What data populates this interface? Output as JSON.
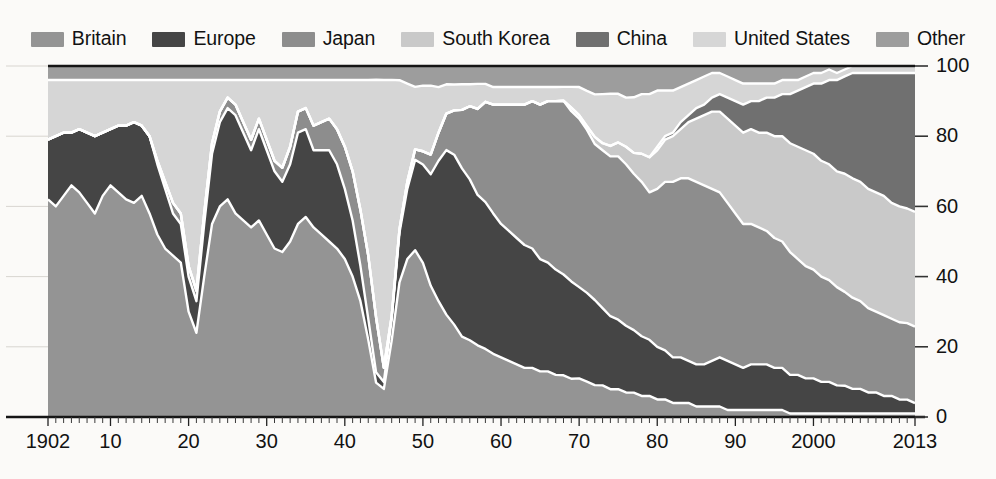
{
  "chart_data": {
    "type": "area",
    "title": "",
    "subtitle": "",
    "xlabel": "",
    "ylabel": "",
    "stacked": true,
    "normalized_percent": true,
    "grid": true,
    "legend_position": "top",
    "xlim": [
      1902,
      2013
    ],
    "ylim": [
      0,
      100
    ],
    "y_ticks": [
      0,
      20,
      40,
      60,
      80,
      100
    ],
    "y_tick_labels": [
      "0",
      "20",
      "40",
      "60",
      "80",
      "100"
    ],
    "y_axis_side": "right",
    "x_tick_years": [
      1902,
      1910,
      1920,
      1930,
      1940,
      1950,
      1960,
      1970,
      1980,
      1990,
      2000,
      2013
    ],
    "x_tick_labels": [
      "1902",
      "10",
      "20",
      "30",
      "40",
      "50",
      "60",
      "70",
      "80",
      "90",
      "2000",
      "2013"
    ],
    "x_minor_step": 1,
    "categories": [
      1902,
      1903,
      1904,
      1905,
      1906,
      1907,
      1908,
      1909,
      1910,
      1911,
      1912,
      1913,
      1914,
      1915,
      1916,
      1917,
      1918,
      1919,
      1920,
      1921,
      1922,
      1923,
      1924,
      1925,
      1926,
      1927,
      1928,
      1929,
      1930,
      1931,
      1932,
      1933,
      1934,
      1935,
      1936,
      1937,
      1938,
      1939,
      1940,
      1941,
      1942,
      1943,
      1944,
      1945,
      1946,
      1947,
      1948,
      1949,
      1950,
      1951,
      1952,
      1953,
      1954,
      1955,
      1956,
      1957,
      1958,
      1959,
      1960,
      1961,
      1962,
      1963,
      1964,
      1965,
      1966,
      1967,
      1968,
      1969,
      1970,
      1971,
      1972,
      1973,
      1974,
      1975,
      1976,
      1977,
      1978,
      1979,
      1980,
      1981,
      1982,
      1983,
      1984,
      1985,
      1986,
      1987,
      1988,
      1989,
      1990,
      1991,
      1992,
      1993,
      1994,
      1995,
      1996,
      1997,
      1998,
      1999,
      2000,
      2001,
      2002,
      2003,
      2004,
      2005,
      2006,
      2007,
      2008,
      2009,
      2010,
      2011,
      2012,
      2013
    ],
    "series": [
      {
        "name": "Britain",
        "color": "#949494",
        "values": [
          62,
          60,
          63,
          66,
          64,
          61,
          58,
          63,
          66,
          64,
          62,
          61,
          63,
          58,
          52,
          48,
          46,
          44,
          30,
          24,
          40,
          55,
          60,
          62,
          58,
          56,
          54,
          56,
          52,
          48,
          47,
          50,
          55,
          57,
          54,
          52,
          50,
          48,
          45,
          40,
          33,
          22,
          10,
          8,
          22,
          38,
          45,
          48,
          47,
          40,
          33,
          28,
          25,
          22,
          21,
          20,
          19,
          18,
          17,
          16,
          15,
          14,
          14,
          13,
          13,
          12,
          12,
          11,
          11,
          10,
          9,
          9,
          8,
          8,
          7,
          7,
          6,
          6,
          5,
          5,
          4,
          4,
          4,
          3,
          3,
          3,
          3,
          2,
          2,
          2,
          2,
          2,
          2,
          2,
          2,
          1,
          1,
          1,
          1,
          1,
          1,
          1,
          1,
          1,
          1,
          1,
          1,
          1,
          1,
          1,
          1,
          1
        ]
      },
      {
        "name": "Europe",
        "color": "#454545",
        "values": [
          17,
          20,
          18,
          15,
          18,
          20,
          22,
          18,
          16,
          19,
          21,
          23,
          20,
          22,
          20,
          17,
          12,
          11,
          10,
          9,
          15,
          20,
          24,
          26,
          28,
          25,
          22,
          26,
          24,
          22,
          20,
          22,
          26,
          25,
          22,
          24,
          26,
          24,
          20,
          16,
          10,
          6,
          3,
          2,
          6,
          14,
          20,
          26,
          30,
          34,
          40,
          45,
          46,
          46,
          44,
          42,
          41,
          40,
          38,
          37,
          36,
          35,
          34,
          32,
          31,
          30,
          29,
          28,
          26,
          25,
          24,
          22,
          21,
          20,
          19,
          18,
          17,
          16,
          15,
          14,
          13,
          13,
          12,
          12,
          12,
          13,
          14,
          14,
          13,
          12,
          13,
          13,
          13,
          12,
          12,
          11,
          11,
          10,
          10,
          9,
          9,
          8,
          8,
          7,
          7,
          6,
          6,
          5,
          5,
          4,
          4,
          3
        ]
      },
      {
        "name": "Japan",
        "color": "#8d8d8d",
        "values": [
          0,
          0,
          0,
          0,
          0,
          0,
          0,
          0,
          0,
          0,
          0,
          0,
          0,
          0,
          1,
          2,
          3,
          3,
          3,
          3,
          3,
          3,
          3,
          3,
          3,
          3,
          3,
          3,
          3,
          3,
          4,
          5,
          6,
          6,
          7,
          8,
          9,
          10,
          12,
          14,
          16,
          18,
          16,
          4,
          1,
          1,
          2,
          3,
          4,
          6,
          8,
          10,
          12,
          16,
          20,
          24,
          28,
          31,
          34,
          36,
          38,
          40,
          42,
          44,
          46,
          48,
          50,
          49,
          48,
          46,
          44,
          45,
          46,
          47,
          46,
          45,
          44,
          42,
          45,
          48,
          50,
          51,
          52,
          52,
          51,
          49,
          47,
          45,
          43,
          41,
          40,
          39,
          38,
          37,
          36,
          35,
          33,
          32,
          31,
          30,
          29,
          28,
          27,
          26,
          25,
          24,
          23,
          23,
          22,
          22,
          22,
          22
        ]
      },
      {
        "name": "South Korea",
        "color": "#c9c9c9",
        "values": [
          0,
          0,
          0,
          0,
          0,
          0,
          0,
          0,
          0,
          0,
          0,
          0,
          0,
          0,
          0,
          0,
          0,
          0,
          0,
          0,
          0,
          0,
          0,
          0,
          0,
          0,
          0,
          0,
          0,
          0,
          0,
          0,
          0,
          0,
          0,
          0,
          0,
          0,
          0,
          0,
          0,
          0,
          0,
          0,
          0,
          0,
          0,
          0,
          0,
          0,
          0,
          0,
          0,
          0,
          0,
          0,
          0,
          0,
          0,
          0,
          0,
          0,
          0,
          0,
          0,
          0,
          0,
          1,
          1,
          1,
          2,
          2,
          3,
          4,
          5,
          6,
          8,
          10,
          11,
          12,
          13,
          14,
          16,
          18,
          20,
          22,
          23,
          24,
          25,
          26,
          27,
          27,
          28,
          29,
          30,
          31,
          32,
          33,
          33,
          33,
          33,
          33,
          34,
          34,
          34,
          34,
          34,
          34,
          33,
          33,
          33,
          33
        ]
      },
      {
        "name": "China",
        "color": "#707070",
        "values": [
          0,
          0,
          0,
          0,
          0,
          0,
          0,
          0,
          0,
          0,
          0,
          0,
          0,
          0,
          0,
          0,
          0,
          0,
          0,
          0,
          0,
          0,
          0,
          0,
          0,
          0,
          0,
          0,
          0,
          0,
          0,
          0,
          0,
          0,
          0,
          0,
          0,
          0,
          0,
          0,
          0,
          0,
          0,
          0,
          0,
          0,
          0,
          0,
          0,
          0,
          0,
          0,
          0,
          0,
          0,
          0,
          0,
          0,
          0,
          0,
          0,
          0,
          0,
          0,
          0,
          0,
          0,
          0,
          0,
          0,
          0,
          0,
          0,
          0,
          0,
          0,
          0,
          0,
          1,
          1,
          1,
          2,
          2,
          3,
          3,
          4,
          5,
          6,
          7,
          8,
          8,
          9,
          10,
          11,
          12,
          14,
          16,
          18,
          20,
          22,
          24,
          26,
          28,
          30,
          31,
          33,
          34,
          35,
          37,
          38,
          39,
          40
        ]
      },
      {
        "name": "United States",
        "color": "#d6d6d6",
        "values": [
          17,
          16,
          15,
          15,
          14,
          15,
          16,
          15,
          14,
          13,
          13,
          12,
          13,
          16,
          23,
          29,
          35,
          38,
          53,
          60,
          38,
          18,
          9,
          5,
          7,
          12,
          17,
          11,
          17,
          23,
          25,
          19,
          9,
          8,
          13,
          12,
          11,
          14,
          19,
          26,
          37,
          50,
          69,
          82,
          68,
          42,
          28,
          18,
          20,
          21,
          13,
          8,
          7,
          7,
          6,
          7,
          5,
          5,
          5,
          5,
          5,
          5,
          4,
          5,
          4,
          4,
          4,
          6,
          8,
          10,
          12,
          14,
          15,
          14,
          14,
          16,
          17,
          18,
          16,
          13,
          12,
          10,
          9,
          8,
          8,
          7,
          6,
          6,
          6,
          6,
          5,
          5,
          4,
          4,
          4,
          4,
          3,
          3,
          3,
          3,
          3,
          2,
          2,
          2,
          2,
          2,
          2,
          2,
          2,
          2,
          2,
          2
        ]
      },
      {
        "name": "Other",
        "color": "#9d9d9d",
        "values": [
          4,
          4,
          4,
          4,
          4,
          4,
          4,
          4,
          4,
          4,
          4,
          4,
          4,
          4,
          4,
          4,
          4,
          4,
          4,
          4,
          4,
          4,
          4,
          4,
          4,
          4,
          4,
          4,
          4,
          4,
          4,
          4,
          4,
          4,
          4,
          4,
          4,
          4,
          4,
          4,
          4,
          4,
          4,
          4,
          4,
          4,
          5,
          6,
          6,
          6,
          6,
          5,
          5,
          5,
          5,
          5,
          5,
          6,
          6,
          6,
          6,
          6,
          6,
          6,
          6,
          6,
          6,
          6,
          6,
          7,
          8,
          8,
          8,
          8,
          9,
          9,
          8,
          8,
          7,
          7,
          7,
          6,
          5,
          4,
          3,
          2,
          2,
          3,
          4,
          5,
          5,
          5,
          5,
          5,
          4,
          4,
          4,
          3,
          2,
          2,
          1,
          2,
          1,
          0,
          0,
          0,
          0,
          0,
          0,
          0,
          0,
          0
        ]
      }
    ]
  },
  "legend": {
    "items": [
      {
        "label": "Britain",
        "color": "#949494",
        "name": "legend-item-britain"
      },
      {
        "label": "Europe",
        "color": "#454545",
        "name": "legend-item-europe"
      },
      {
        "label": "Japan",
        "color": "#8d8d8d",
        "name": "legend-item-japan"
      },
      {
        "label": "South Korea",
        "color": "#c9c9c9",
        "name": "legend-item-south-korea"
      },
      {
        "label": "China",
        "color": "#707070",
        "name": "legend-item-china"
      },
      {
        "label": "United States",
        "color": "#d6d6d6",
        "name": "legend-item-united-states"
      },
      {
        "label": "Other",
        "color": "#9d9d9d",
        "name": "legend-item-other"
      }
    ]
  },
  "colors": {
    "background": "#fbfaf8",
    "axis": "#151515",
    "grid": "#d8d5d0",
    "band_separator": "#ffffff",
    "text": "#121212"
  }
}
